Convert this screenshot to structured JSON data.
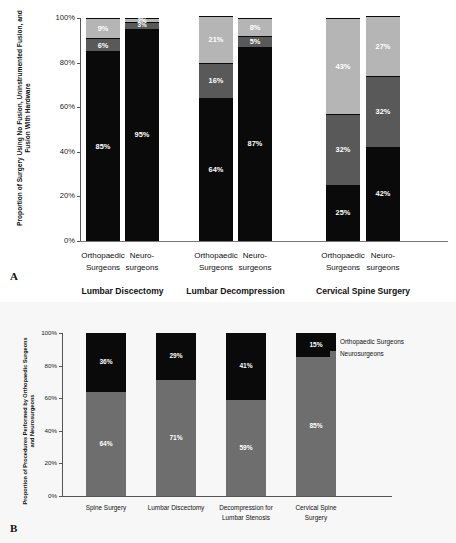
{
  "figure": {
    "panel_a_letter": "A",
    "panel_b_letter": "B"
  },
  "panel_a": {
    "ytitle": "Proportion of Surgery Using No Fusion, Uninstrumented Fusion, and Fusion With Hardware",
    "yticks": [
      "100%",
      "80%",
      "60%",
      "40%",
      "20%",
      "0%"
    ],
    "groups": [
      {
        "title": "Lumbar Discectomy",
        "bars": [
          {
            "label": "Orthopaedic\nSurgeons",
            "segments": [
              {
                "name": "No Fusion",
                "value": 85,
                "display": "85%"
              },
              {
                "name": "Uninstrumented Fusion",
                "value": 6,
                "display": "6%"
              },
              {
                "name": "Fusion With Hardware",
                "value": 9,
                "display": "9%"
              }
            ]
          },
          {
            "label": "Neuro-\nsurgeons",
            "segments": [
              {
                "name": "No Fusion",
                "value": 95,
                "display": "95%"
              },
              {
                "name": "Uninstrumented Fusion",
                "value": 3,
                "display": "3%"
              },
              {
                "name": "Fusion With Hardware",
                "value": 2,
                "display": "2%"
              }
            ]
          }
        ]
      },
      {
        "title": "Lumbar Decompression",
        "bars": [
          {
            "label": "Orthopaedic\nSurgeons",
            "segments": [
              {
                "name": "No Fusion",
                "value": 64,
                "display": "64%"
              },
              {
                "name": "Uninstrumented Fusion",
                "value": 16,
                "display": "16%"
              },
              {
                "name": "Fusion With Hardware",
                "value": 21,
                "display": "21%"
              }
            ]
          },
          {
            "label": "Neuro-\nsurgeons",
            "segments": [
              {
                "name": "No Fusion",
                "value": 87,
                "display": "87%"
              },
              {
                "name": "Uninstrumented Fusion",
                "value": 5,
                "display": "5%"
              },
              {
                "name": "Fusion With Hardware",
                "value": 8,
                "display": "8%"
              }
            ]
          }
        ]
      },
      {
        "title": "Cervical Spine Surgery",
        "bars": [
          {
            "label": "Orthopaedic\nSurgeons",
            "segments": [
              {
                "name": "No Fusion",
                "value": 25,
                "display": "25%"
              },
              {
                "name": "Uninstrumented Fusion",
                "value": 32,
                "display": "32%"
              },
              {
                "name": "Fusion With Hardware",
                "value": 43,
                "display": "43%"
              }
            ]
          },
          {
            "label": "Neuro-\nsurgeons",
            "segments": [
              {
                "name": "No Fusion",
                "value": 42,
                "display": "42%"
              },
              {
                "name": "Uninstrumented Fusion",
                "value": 32,
                "display": "32%"
              },
              {
                "name": "Fusion With Hardware",
                "value": 27,
                "display": "27%"
              }
            ]
          }
        ]
      }
    ]
  },
  "panel_b": {
    "ytitle": "Proportion of Procedures Performed by Orthopaedic Surgeons and Neurosurgeons",
    "yticks": [
      "100%",
      "80%",
      "60%",
      "40%",
      "20%",
      "0%"
    ],
    "legend": [
      {
        "label": "Orthopaedic Surgeons",
        "color": "#0a0a0a"
      },
      {
        "label": "Neurosurgeons",
        "color": "#6e6e6e"
      }
    ],
    "bars": [
      {
        "label": "Spine Surgery",
        "neuro": 64,
        "neuro_display": "64%",
        "ortho": 36,
        "ortho_display": "36%"
      },
      {
        "label": "Lumbar Discectomy",
        "neuro": 71,
        "neuro_display": "71%",
        "ortho": 29,
        "ortho_display": "29%"
      },
      {
        "label": "Decompression for\nLumbar Stenosis",
        "neuro": 59,
        "neuro_display": "59%",
        "ortho": 41,
        "ortho_display": "41%"
      },
      {
        "label": "Cervical Spine\nSurgery",
        "neuro": 85,
        "neuro_display": "85%",
        "ortho": 15,
        "ortho_display": "15%"
      }
    ]
  },
  "chart_data": [
    {
      "type": "bar",
      "subtype": "stacked-grouped",
      "panel": "A",
      "title": "",
      "ylabel": "Proportion of Surgery Using No Fusion, Uninstrumented Fusion, and Fusion With Hardware",
      "xlabel": "",
      "ylim": [
        0,
        100
      ],
      "yticks": [
        0,
        20,
        40,
        60,
        80,
        100
      ],
      "ytick_labels": [
        "0%",
        "20%",
        "40%",
        "60%",
        "80%",
        "100%"
      ],
      "grid": false,
      "legend_position": "none",
      "groups": [
        "Lumbar Discectomy",
        "Lumbar Decompression",
        "Cervical Spine Surgery"
      ],
      "categories": [
        "Lumbar Discectomy / Orthopaedic Surgeons",
        "Lumbar Discectomy / Neurosurgeons",
        "Lumbar Decompression / Orthopaedic Surgeons",
        "Lumbar Decompression / Neurosurgeons",
        "Cervical Spine Surgery / Orthopaedic Surgeons",
        "Cervical Spine Surgery / Neurosurgeons"
      ],
      "series": [
        {
          "name": "No Fusion",
          "color": "#0a0a0a",
          "values": [
            85,
            95,
            64,
            87,
            25,
            42
          ]
        },
        {
          "name": "Uninstrumented Fusion",
          "color": "#595959",
          "values": [
            6,
            3,
            16,
            5,
            32,
            32
          ]
        },
        {
          "name": "Fusion With Hardware",
          "color": "#b5b5b5",
          "values": [
            9,
            2,
            21,
            8,
            43,
            27
          ]
        }
      ]
    },
    {
      "type": "bar",
      "subtype": "stacked",
      "panel": "B",
      "title": "",
      "ylabel": "Proportion of Procedures Performed by Orthopaedic Surgeons and Neurosurgeons",
      "xlabel": "",
      "ylim": [
        0,
        100
      ],
      "yticks": [
        0,
        20,
        40,
        60,
        80,
        100
      ],
      "ytick_labels": [
        "0%",
        "20%",
        "40%",
        "60%",
        "80%",
        "100%"
      ],
      "grid": false,
      "legend_position": "right",
      "categories": [
        "Spine Surgery",
        "Lumbar Discectomy",
        "Decompression for Lumbar Stenosis",
        "Cervical Spine Surgery"
      ],
      "series": [
        {
          "name": "Neurosurgeons",
          "color": "#6e6e6e",
          "values": [
            64,
            71,
            59,
            85
          ]
        },
        {
          "name": "Orthopaedic Surgeons",
          "color": "#0a0a0a",
          "values": [
            36,
            29,
            41,
            15
          ]
        }
      ]
    }
  ]
}
